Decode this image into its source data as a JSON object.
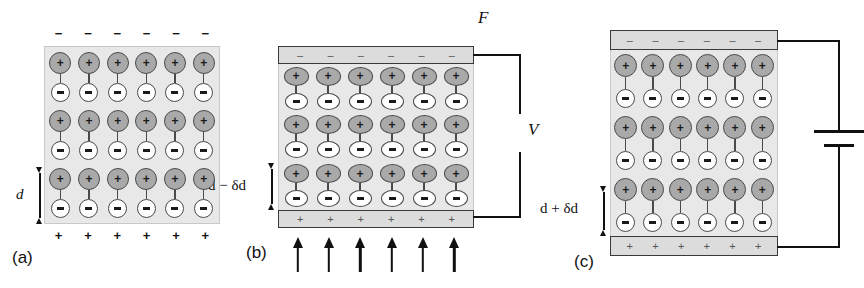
{
  "figure": {
    "type": "piezoelectric-effect-diagram",
    "panel_count": 3,
    "colors": {
      "dielectric_fill": "#e8e8e8",
      "positive_ion_fill": "#a9a9a9",
      "negative_ion_fill": "#ffffff",
      "electrode_fill": "#dcdcdc",
      "outline": "#4a4a4a",
      "wire": "#111111"
    }
  },
  "symbols": {
    "plus": "+",
    "minus": "−",
    "minus_short": "–"
  },
  "panels": [
    {
      "id": "a",
      "caption": "(a)",
      "state": "unstressed",
      "lattice": {
        "columns": 6,
        "rows": 3,
        "dipole_count": 18,
        "shape": "circle"
      },
      "top_charges": {
        "sign": "−",
        "count": 6,
        "style": "free-surface"
      },
      "bottom_charges": {
        "sign": "+",
        "count": 6,
        "style": "free-surface"
      },
      "electrodes": false,
      "dimension": {
        "label_parts": [
          {
            "text": "d",
            "italic": true
          }
        ],
        "label_text": "d"
      },
      "force_arrows": {
        "top": 0,
        "bottom": 0
      },
      "circuit": "none"
    },
    {
      "id": "b",
      "caption": "(b)",
      "state": "compressed",
      "lattice": {
        "columns": 6,
        "rows": 3,
        "dipole_count": 18,
        "shape": "flattened-ellipse"
      },
      "top_charges": {
        "sign": "–",
        "count": 6,
        "style": "electrode"
      },
      "bottom_charges": {
        "sign": "+",
        "count": 6,
        "style": "electrode"
      },
      "electrodes": true,
      "dimension": {
        "label_parts": [
          {
            "text": "d",
            "italic": true
          },
          {
            "text": " − ",
            "italic": false
          },
          {
            "text": "δd",
            "italic": false
          }
        ],
        "label_text": "d − δd"
      },
      "force_arrows": {
        "top": 6,
        "bottom": 6,
        "direction_top": "down",
        "direction_bottom": "up"
      },
      "force_label": "F",
      "circuit": "voltmeter",
      "circuit_label": "V"
    },
    {
      "id": "c",
      "caption": "(c)",
      "state": "expanded",
      "lattice": {
        "columns": 6,
        "rows": 3,
        "dipole_count": 18,
        "shape": "elongated-circle"
      },
      "top_charges": {
        "sign": "–",
        "count": 6,
        "style": "electrode"
      },
      "bottom_charges": {
        "sign": "+",
        "count": 6,
        "style": "electrode"
      },
      "electrodes": true,
      "dimension": {
        "label_parts": [
          {
            "text": "d",
            "italic": true
          },
          {
            "text": " + ",
            "italic": false
          },
          {
            "text": "δd",
            "italic": false
          }
        ],
        "label_text": "d + δd"
      },
      "force_arrows": {
        "top": 0,
        "bottom": 0
      },
      "circuit": "battery",
      "circuit_label": ""
    }
  ]
}
